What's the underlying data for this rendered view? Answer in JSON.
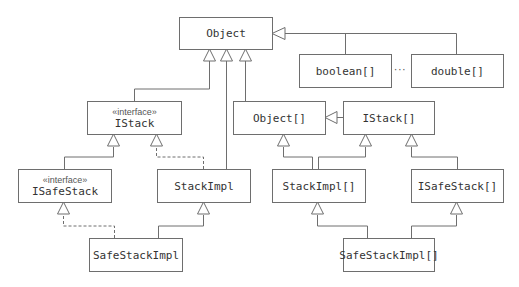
{
  "diagram": {
    "type": "uml-class-hierarchy",
    "colors": {
      "line": "#6e6e6e",
      "text": "#333333",
      "background": "#ffffff"
    },
    "ellipsis": "···",
    "boxes": {
      "object": {
        "name": "Object"
      },
      "boolean_array": {
        "name": "boolean[]"
      },
      "double_array": {
        "name": "double[]"
      },
      "istack": {
        "stereotype": "«interface»",
        "name": "IStack"
      },
      "object_array": {
        "name": "Object[]"
      },
      "istack_array": {
        "name": "IStack[]"
      },
      "isafestack": {
        "stereotype": "«interface»",
        "name": "ISafeStack"
      },
      "stackimpl": {
        "name": "StackImpl"
      },
      "stackimpl_array": {
        "name": "StackImpl[]"
      },
      "isafestack_array": {
        "name": "ISafeStack[]"
      },
      "safestackimpl": {
        "name": "SafeStackImpl"
      },
      "safestackimpl_array": {
        "name": "SafeStackImpl[]"
      }
    },
    "relations": [
      {
        "from": "IStack",
        "to": "Object",
        "kind": "inheritance"
      },
      {
        "from": "StackImpl",
        "to": "Object",
        "kind": "inheritance"
      },
      {
        "from": "Object[]",
        "to": "Object",
        "kind": "inheritance"
      },
      {
        "from": "boolean[]",
        "to": "Object",
        "kind": "inheritance"
      },
      {
        "from": "double[]",
        "to": "Object",
        "kind": "inheritance"
      },
      {
        "from": "ISafeStack",
        "to": "IStack",
        "kind": "inheritance"
      },
      {
        "from": "StackImpl",
        "to": "IStack",
        "kind": "realization"
      },
      {
        "from": "SafeStackImpl",
        "to": "ISafeStack",
        "kind": "realization"
      },
      {
        "from": "SafeStackImpl",
        "to": "StackImpl",
        "kind": "inheritance"
      },
      {
        "from": "IStack[]",
        "to": "Object[]",
        "kind": "inheritance"
      },
      {
        "from": "StackImpl[]",
        "to": "Object[]",
        "kind": "inheritance"
      },
      {
        "from": "StackImpl[]",
        "to": "IStack[]",
        "kind": "inheritance"
      },
      {
        "from": "ISafeStack[]",
        "to": "IStack[]",
        "kind": "inheritance"
      },
      {
        "from": "SafeStackImpl[]",
        "to": "StackImpl[]",
        "kind": "inheritance"
      },
      {
        "from": "SafeStackImpl[]",
        "to": "ISafeStack[]",
        "kind": "inheritance"
      }
    ]
  }
}
